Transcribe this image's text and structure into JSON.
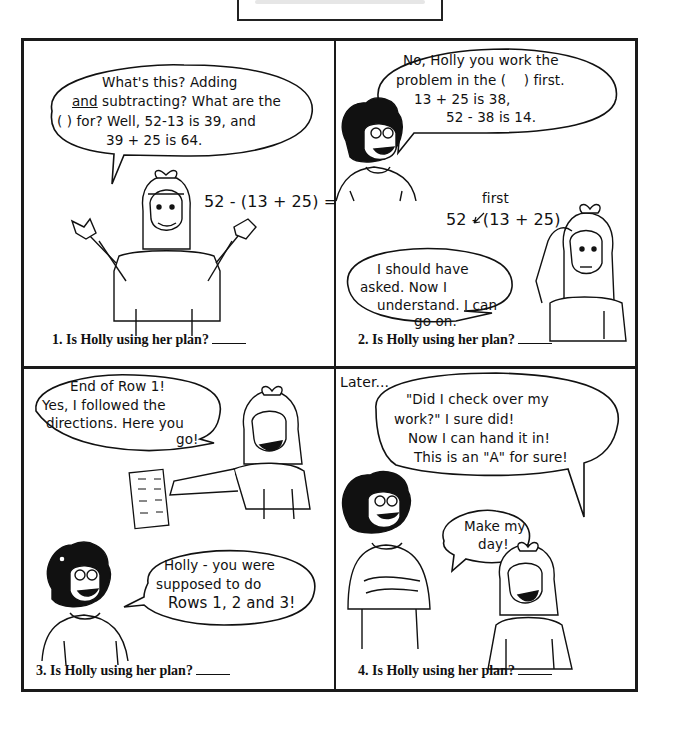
{
  "page": {
    "title_strip_text": ""
  },
  "panels": [
    {
      "number": 1,
      "bubbles": [
        {
          "speaker": "Holly",
          "lines": [
            "What's this? Adding",
            "and subtracting? What are the",
            "( ) for? Well, 52-13 is 39, and",
            "39 + 25 is 64."
          ],
          "underlined_word": "and"
        }
      ],
      "board_expression": "52 - (13 + 25) =",
      "question": "1. Is Holly using her plan?"
    },
    {
      "number": 2,
      "bubbles": [
        {
          "speaker": "Teacher",
          "lines": [
            "No, Holly you work the",
            "problem in the (    ) first.",
            "13 + 25 is 38,",
            "52 - 38 is 14."
          ]
        },
        {
          "speaker": "Holly",
          "lines": [
            "I should have",
            "asked. Now I",
            "understand. I can",
            "go on."
          ]
        }
      ],
      "board_expression": "52 - (13 + 25)",
      "annotation": "first",
      "question": "2. Is Holly using her plan?"
    },
    {
      "number": 3,
      "bubbles": [
        {
          "speaker": "Holly",
          "lines": [
            "End of Row 1!",
            "Yes, I followed the",
            "directions. Here you",
            "go!"
          ]
        },
        {
          "speaker": "Teacher",
          "lines": [
            "Holly - you were",
            "supposed to do",
            "Rows 1, 2 and 3!"
          ]
        }
      ],
      "question": "3. Is Holly using her plan?"
    },
    {
      "number": 4,
      "caption": "Later...",
      "bubbles": [
        {
          "speaker": "Holly",
          "lines": [
            "\"Did I check over my",
            "work?\" I sure did!",
            "Now I can hand it in!",
            "This is an \"A\" for sure!"
          ]
        },
        {
          "speaker": "Teacher",
          "lines": [
            "Make my",
            "day!"
          ]
        }
      ],
      "question": "4. Is Holly using her plan?"
    }
  ]
}
